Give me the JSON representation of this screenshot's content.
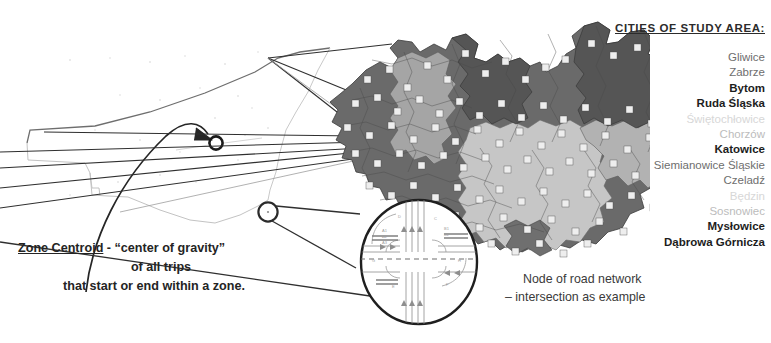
{
  "figure": {
    "background_color": "#ffffff",
    "ink_color": "#333333"
  },
  "city_panel": {
    "title": "CITIES OF STUDY AREA:",
    "items": [
      {
        "name": "Gliwice",
        "emphasis": "normal"
      },
      {
        "name": "Zabrze",
        "emphasis": "normal"
      },
      {
        "name": "Bytom",
        "emphasis": "bold"
      },
      {
        "name": "Ruda Śląska",
        "emphasis": "bold"
      },
      {
        "name": "Świętochłowice",
        "emphasis": "xfaint"
      },
      {
        "name": "Chorzów",
        "emphasis": "faint"
      },
      {
        "name": "Katowice",
        "emphasis": "bold"
      },
      {
        "name": "Siemianowice Śląskie",
        "emphasis": "normal"
      },
      {
        "name": "Czeladź",
        "emphasis": "normal"
      },
      {
        "name": "Będzin",
        "emphasis": "xfaint"
      },
      {
        "name": "Sosnowiec",
        "emphasis": "faint"
      },
      {
        "name": "Mysłowice",
        "emphasis": "bold"
      },
      {
        "name": "Dąbrowa Górnicza",
        "emphasis": "bold"
      }
    ]
  },
  "caption_left": {
    "term": "Zone Centroid",
    "line1_rest": " - “center of gravity”",
    "line2": "of all trips",
    "line3": "that start or end within a zone."
  },
  "caption_right": {
    "line1": "Node of road network",
    "line2": "– intersection as example"
  },
  "map": {
    "label": "grayscale choropleth of study area zones",
    "zone_fill_light": "#cfcfcf",
    "zone_fill_mid": "#9a9a9a",
    "zone_fill_dark": "#5e5e5e",
    "zone_border": "#3a3a3a",
    "zone_marker_fill": "#eeeeee"
  },
  "callouts": {
    "centroid_marker_label": "zone centroid marker",
    "node_marker_label": "road network node marker",
    "inset_label": "magnified intersection diagram"
  }
}
